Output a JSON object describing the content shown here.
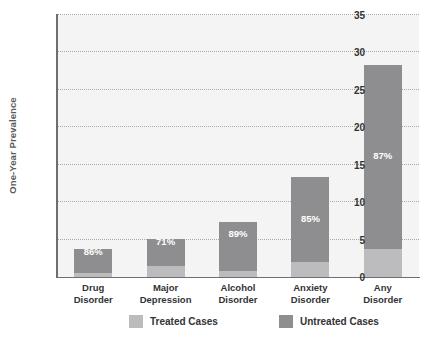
{
  "chart_data": {
    "type": "bar",
    "subtype": "stacked-bar",
    "title": "",
    "xlabel": "",
    "ylabel": "One-Year Prevalence",
    "ylim": [
      0,
      35
    ],
    "yticks": [
      0,
      5,
      10,
      15,
      20,
      25,
      30,
      35
    ],
    "ytick_labels": [
      "0",
      "5",
      "10",
      "15",
      "20",
      "25",
      "30",
      "35"
    ],
    "grid": true,
    "grid_style": "dotted-horizontal",
    "legend_position": "bottom",
    "categories": [
      [
        "Drug",
        "Disorder"
      ],
      [
        "Major",
        "Depression"
      ],
      [
        "Alcohol",
        "Disorder"
      ],
      [
        "Anxiety",
        "Disorder"
      ],
      [
        "Any",
        "Disorder"
      ]
    ],
    "category_labels": [
      "Drug Disorder",
      "Major Depression",
      "Alcohol Disorder",
      "Anxiety Disorder",
      "Any Disorder"
    ],
    "series": [
      {
        "name": "Treated Cases",
        "color": "#bcbcbe",
        "values": [
          0.5,
          1.5,
          0.8,
          2.0,
          3.7
        ]
      },
      {
        "name": "Untreated Cases",
        "color": "#8e8e90",
        "values": [
          3.2,
          3.6,
          6.5,
          11.3,
          24.6
        ]
      }
    ],
    "totals": [
      3.7,
      5.1,
      7.3,
      13.3,
      28.3
    ],
    "untreated_pct_labels": [
      "86%",
      "71%",
      "89%",
      "85%",
      "87%"
    ],
    "bar_label_y_values": [
      2.0,
      3.3,
      4.4,
      6.4,
      14.8
    ]
  },
  "legend": {
    "items": [
      {
        "label": "Treated Cases",
        "swatch": "treated"
      },
      {
        "label": "Untreated Cases",
        "swatch": "untreated"
      }
    ]
  },
  "colors": {
    "plot_background": "#f4f4f4",
    "page_background": "#ffffff",
    "axis": "#6f6f71",
    "gridline": "#a9a9ab",
    "treated": "#bcbcbe",
    "untreated": "#8e8e90",
    "text": "#333335",
    "axis_title_text": "#59595b",
    "bar_label_text": "#ffffff"
  }
}
